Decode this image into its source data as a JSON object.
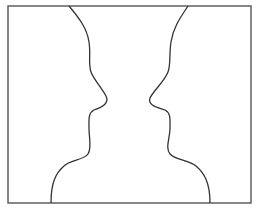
{
  "figure": {
    "frame_color": "#555555",
    "line_color": "#333333",
    "background": "#ffffff"
  }
}
